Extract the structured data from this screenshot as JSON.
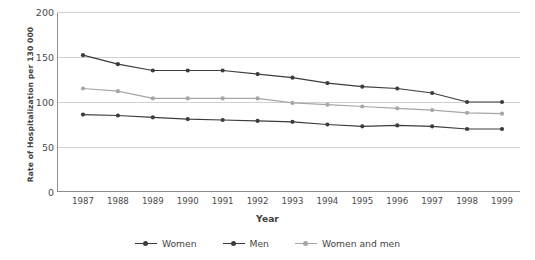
{
  "chart_data": {
    "type": "line",
    "title": "",
    "xlabel": "Year",
    "ylabel": "Rate of Hospitalization per 130 000",
    "categories": [
      "1987",
      "1988",
      "1989",
      "1990",
      "1991",
      "1992",
      "1993",
      "1994",
      "1995",
      "1996",
      "1997",
      "1998",
      "1999"
    ],
    "ylim": [
      0,
      200
    ],
    "yticks": [
      0,
      50,
      100,
      150,
      200
    ],
    "grid": true,
    "legend_position": "bottom",
    "series": [
      {
        "name": "Women",
        "color": "#3c3c3c",
        "values": [
          152,
          142,
          135,
          135,
          135,
          131,
          127,
          121,
          117,
          115,
          110,
          100,
          100
        ]
      },
      {
        "name": "Men",
        "color": "#3c3c3c",
        "values": [
          86,
          85,
          83,
          81,
          80,
          79,
          78,
          75,
          73,
          74,
          73,
          70,
          70
        ]
      },
      {
        "name": "Women and men",
        "color": "#a6a6a6",
        "values": [
          115,
          112,
          104,
          104,
          104,
          104,
          99,
          97,
          95,
          93,
          91,
          88,
          87
        ]
      }
    ]
  },
  "axis": {
    "y_tick_labels": [
      "200",
      "150",
      "100",
      "50",
      "0"
    ],
    "x_tick_labels": [
      "1987",
      "1988",
      "1989",
      "1990",
      "1991",
      "1992",
      "1993",
      "1994",
      "1995",
      "1996",
      "1997",
      "1998",
      "1999"
    ],
    "y_axis_title": "Rate of Hospitalization per 130 000",
    "x_axis_title": "Year"
  },
  "legend": {
    "items": [
      {
        "label": "Women",
        "color": "#3c3c3c"
      },
      {
        "label": "Men",
        "color": "#3c3c3c"
      },
      {
        "label": "Women and men",
        "color": "#a6a6a6"
      }
    ]
  },
  "style": {
    "grid_color": "#d0d0d0",
    "axis_color": "#8c8c8c",
    "background": "#ffffff"
  }
}
